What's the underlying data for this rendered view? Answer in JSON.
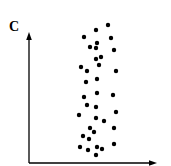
{
  "panel_label": "C",
  "colors": {
    "axis": "#000000",
    "dot": "#000000",
    "background": "#ffffff"
  },
  "chart_data": {
    "type": "scatter",
    "title": "",
    "panel_label": "C",
    "xlabel": "",
    "ylabel": "",
    "x_ticks": [],
    "y_ticks": [],
    "grid": false,
    "legend": null,
    "units": "pixel coordinates (no numeric axis scale shown)",
    "axes": {
      "origin": [
        29,
        163
      ],
      "x_end": [
        157,
        163
      ],
      "y_end": [
        29,
        32
      ]
    },
    "points": [
      [
        108,
        25
      ],
      [
        96,
        30
      ],
      [
        84,
        37
      ],
      [
        111,
        38
      ],
      [
        97,
        43
      ],
      [
        90,
        47
      ],
      [
        96,
        48
      ],
      [
        114,
        50
      ],
      [
        101,
        57
      ],
      [
        96,
        59
      ],
      [
        99,
        65
      ],
      [
        81,
        67
      ],
      [
        87,
        71
      ],
      [
        116,
        71
      ],
      [
        97,
        79
      ],
      [
        86,
        82
      ],
      [
        97,
        93
      ],
      [
        113,
        95
      ],
      [
        84,
        97
      ],
      [
        87,
        105
      ],
      [
        96,
        107
      ],
      [
        116,
        112
      ],
      [
        79,
        115
      ],
      [
        96,
        118
      ],
      [
        104,
        121
      ],
      [
        90,
        128
      ],
      [
        114,
        128
      ],
      [
        94,
        132
      ],
      [
        83,
        136
      ],
      [
        89,
        139
      ],
      [
        114,
        144
      ],
      [
        80,
        147
      ],
      [
        97,
        147
      ],
      [
        102,
        149
      ],
      [
        88,
        150
      ],
      [
        96,
        155
      ]
    ],
    "point_radius": 2.2
  }
}
